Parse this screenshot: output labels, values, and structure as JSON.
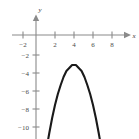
{
  "figure": {
    "corner_label": "",
    "axis_color": "#8a8a8a",
    "curve_color": "#1a1a1a",
    "tick_label_color": "#4a4a4a"
  },
  "axes": {
    "x_axis_name": "x",
    "y_axis_name": "y"
  },
  "chart_data": {
    "type": "line",
    "title": "",
    "xlabel": "x",
    "ylabel": "y",
    "xlim": [
      -3,
      9.4
    ],
    "ylim": [
      -11.2,
      1.2
    ],
    "grid": false,
    "legend": "none",
    "x_ticks": [
      -2,
      2,
      4,
      6,
      8
    ],
    "x_tick_labels": [
      "−2",
      "2",
      "4",
      "6",
      "8"
    ],
    "y_ticks": [
      -2,
      -4,
      -6,
      -8,
      -10
    ],
    "y_tick_labels": [
      "−2",
      "−4",
      "−6",
      "−8",
      "−10"
    ],
    "series": [
      {
        "name": "parabola",
        "equation": "y = -(x-4)^2 - 3",
        "vertex": [
          4,
          -3
        ],
        "opens": "down",
        "x": [
          1.1,
          1.4,
          1.7,
          2.0,
          2.3,
          2.6,
          2.9,
          3.2,
          3.5,
          3.8,
          4.0,
          4.2,
          4.5,
          4.8,
          5.1,
          5.4,
          5.7,
          6.0,
          6.3,
          6.6,
          6.9
        ],
        "values": [
          -11.4,
          -9.8,
          -8.3,
          -7.0,
          -5.9,
          -5.0,
          -4.2,
          -3.6,
          -3.3,
          -3.0,
          -3.0,
          -3.0,
          -3.3,
          -3.6,
          -4.2,
          -5.0,
          -5.9,
          -7.0,
          -8.3,
          -9.8,
          -11.4
        ]
      }
    ]
  }
}
